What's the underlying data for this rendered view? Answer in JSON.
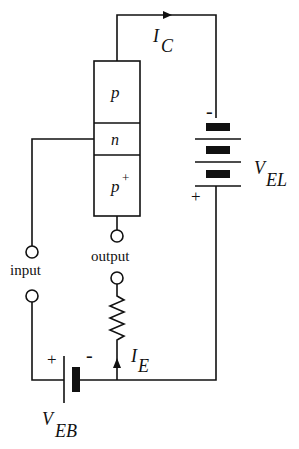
{
  "diagram": {
    "type": "pnp-transistor-circuit",
    "device": {
      "regions": [
        {
          "id": "collector",
          "label": "p"
        },
        {
          "id": "base",
          "label": "n"
        },
        {
          "id": "emitter",
          "label": "p",
          "superscript": "+"
        }
      ]
    },
    "terminals": {
      "input_label": "input",
      "output_label": "output"
    },
    "currents": {
      "collector": {
        "symbol": "I",
        "subscript": "C"
      },
      "emitter": {
        "symbol": "I",
        "subscript": "E"
      }
    },
    "sources": {
      "collector_battery": {
        "symbol": "V",
        "subscript": "EL",
        "minus": "-",
        "plus": "+"
      },
      "emitter_battery": {
        "symbol": "V",
        "subscript": "EB",
        "minus": "-",
        "plus": "+"
      }
    },
    "colors": {
      "line": "#111111",
      "background": "#ffffff"
    }
  }
}
